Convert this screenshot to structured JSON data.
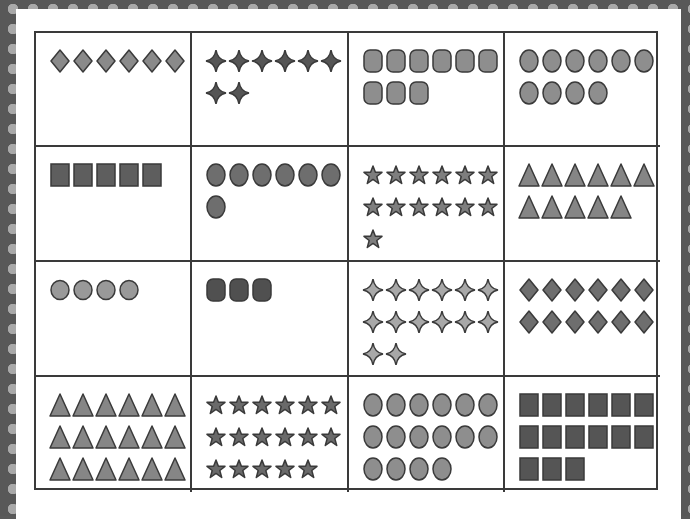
{
  "worksheet": {
    "title": "Counting cards",
    "colors": {
      "frame_dark": "#585858",
      "frame_dot": "#a9a9a9",
      "line": "#3a3a3a",
      "fill_light": "#8e8e8e",
      "fill_mid": "#7a7a7a",
      "fill_dark": "#555555",
      "fill_sparkle_light": "#a8a8a8"
    },
    "cards": [
      {
        "shape": "diamond-icon",
        "count": 6,
        "fill": "#8a8a8a"
      },
      {
        "shape": "sparkle-icon",
        "count": 8,
        "fill": "#555555"
      },
      {
        "shape": "rounded-square-icon",
        "count": 9,
        "fill": "#8e8e8e"
      },
      {
        "shape": "oval-icon",
        "count": 10,
        "fill": "#8e8e8e"
      },
      {
        "shape": "square-icon",
        "count": 5,
        "fill": "#5e5e5e"
      },
      {
        "shape": "oval-icon",
        "count": 7,
        "fill": "#6e6e6e"
      },
      {
        "shape": "star-icon",
        "count": 13,
        "fill": "#7e7e7e"
      },
      {
        "shape": "triangle-icon",
        "count": 11,
        "fill": "#858585"
      },
      {
        "shape": "circle-icon",
        "count": 4,
        "fill": "#999999"
      },
      {
        "shape": "rounded-square-icon",
        "count": 3,
        "fill": "#505050"
      },
      {
        "shape": "sparkle-icon",
        "count": 14,
        "fill": "#a8a8a8"
      },
      {
        "shape": "diamond-icon",
        "count": 12,
        "fill": "#6e6e6e"
      },
      {
        "shape": "triangle-icon",
        "count": 18,
        "fill": "#868686"
      },
      {
        "shape": "star-icon",
        "count": 17,
        "fill": "#6a6a6a"
      },
      {
        "shape": "oval-icon",
        "count": 16,
        "fill": "#8e8e8e"
      },
      {
        "shape": "square-icon",
        "count": 15,
        "fill": "#555555"
      }
    ]
  }
}
